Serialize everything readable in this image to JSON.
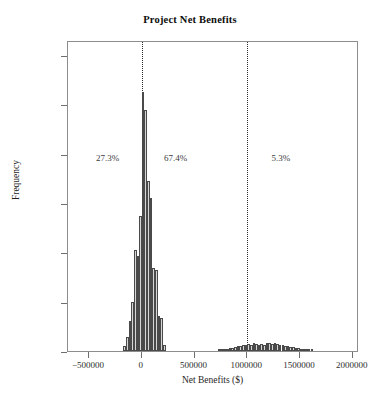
{
  "chart_data": {
    "type": "bar",
    "title": "Project Net Benefits",
    "xlabel": "Net Benefits ($)",
    "ylabel": "Frequency",
    "xlim": [
      -700000,
      2060000
    ],
    "ylim": [
      0,
      1260
    ],
    "grid": false,
    "legend": "none",
    "xticks": [
      -500000,
      0,
      500000,
      1000000,
      1500000,
      2000000
    ],
    "xtick_labels": [
      "−500000",
      "0",
      "500000",
      "1000000",
      "1500000",
      "2000000"
    ],
    "yticks": [
      0,
      200,
      400,
      600,
      800,
      1000,
      1200
    ],
    "ytick_labels": [
      "0",
      "200",
      "400",
      "600",
      "800",
      "1,000",
      "1,200"
    ],
    "bin_width": 25000,
    "bin_starts": [
      -175000,
      -150000,
      -125000,
      -100000,
      -75000,
      -50000,
      -25000,
      0,
      25000,
      50000,
      75000,
      100000,
      125000,
      150000,
      175000,
      200000,
      725000,
      750000,
      775000,
      800000,
      825000,
      850000,
      875000,
      900000,
      925000,
      950000,
      975000,
      1000000,
      1025000,
      1050000,
      1075000,
      1100000,
      1125000,
      1150000,
      1175000,
      1200000,
      1225000,
      1250000,
      1275000,
      1300000,
      1325000,
      1350000,
      1375000,
      1400000,
      1425000,
      1450000,
      1475000,
      1500000,
      1525000,
      1550000,
      1575000,
      1600000
    ],
    "values": [
      20,
      55,
      120,
      200,
      410,
      385,
      545,
      1050,
      975,
      690,
      620,
      335,
      330,
      140,
      135,
      25,
      4,
      6,
      8,
      10,
      12,
      14,
      16,
      22,
      20,
      26,
      24,
      30,
      26,
      32,
      28,
      24,
      30,
      26,
      34,
      32,
      28,
      34,
      30,
      26,
      24,
      22,
      20,
      18,
      16,
      14,
      12,
      10,
      8,
      6,
      4,
      3
    ],
    "reference_lines": [
      {
        "name": "zero-line",
        "x": 0,
        "style": "dotted"
      },
      {
        "name": "threshold-line",
        "x": 1000000,
        "style": "dotted"
      }
    ],
    "annotations": [
      {
        "name": "pct-left",
        "label": "27.3%",
        "x": -325000,
        "y": 790
      },
      {
        "name": "pct-middle",
        "label": "67.4%",
        "x": 320000,
        "y": 790
      },
      {
        "name": "pct-right",
        "label": "5.3%",
        "x": 1320000,
        "y": 790
      }
    ]
  }
}
